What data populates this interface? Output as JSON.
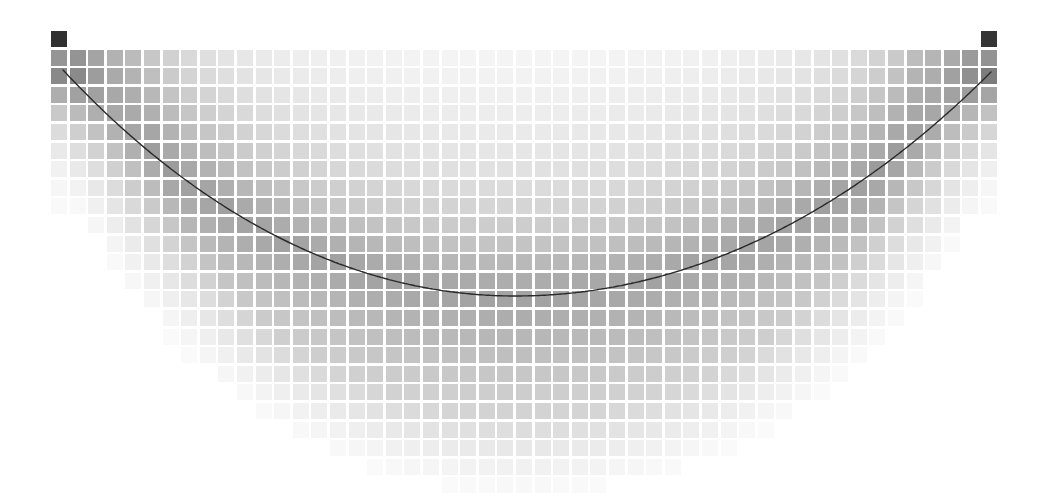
{
  "chart_data": {
    "type": "heatmap",
    "title": "",
    "xlabel": "",
    "ylabel": "",
    "legend": null,
    "grid": {
      "origin_x": 51,
      "origin_y": 31,
      "cell_size": 16,
      "pitch": 18.6,
      "columns": 51,
      "rows": 25,
      "background": "#ffffff",
      "cell_color_dark": "#1e1e1e",
      "cell_color_light": "#ffffff"
    },
    "anchor_cells": [
      {
        "col": 0,
        "row": 0,
        "shade": 0.92
      },
      {
        "col": 50,
        "row": 0,
        "shade": 0.9
      }
    ],
    "overlay_curve": {
      "type": "catenary",
      "start": [
        63,
        70
      ],
      "vertex": [
        515,
        296
      ],
      "end": [
        991,
        72
      ],
      "color": "#2a2a2a"
    },
    "shading_model": "darkness decreases with distance from the curve and from the anchor points; cells fade to white below and outside the arc"
  }
}
